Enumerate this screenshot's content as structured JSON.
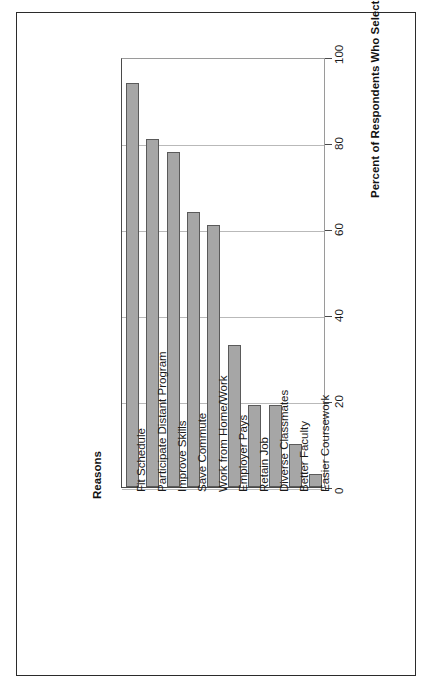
{
  "scan": {
    "top_clipped_text": ""
  },
  "chart_data": {
    "type": "bar",
    "orientation": "rotated-90",
    "title": "",
    "xlabel": "Reasons",
    "ylabel": "Percent of Respondents Who Selected Reason",
    "categories": [
      "Fit Schedule",
      "Participate Distant Program",
      "Improve Skills",
      "Save Commute",
      "Work from Home/Work",
      "Employer Pays",
      "Retain Job",
      "Diverse Classmates",
      "Better Faculty",
      "Easier Coursework"
    ],
    "values": [
      94,
      81,
      78,
      64,
      61,
      33,
      19,
      19,
      10,
      3
    ],
    "ylim": [
      0,
      100
    ],
    "yticks": [
      0,
      20,
      40,
      60,
      80,
      100
    ],
    "ytick_labels": [
      "0",
      "20",
      "40",
      "60",
      "80",
      "100"
    ],
    "grid": true,
    "legend": false,
    "bar_color": "#a6a6a6",
    "bar_border_color": "#5a5a5a",
    "axis_color": "#4a4a4a",
    "grid_color": "#b9b9b9",
    "background": "#ffffff"
  }
}
